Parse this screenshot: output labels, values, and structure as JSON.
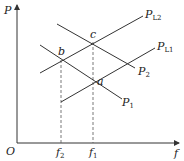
{
  "axes": {
    "y_label": "P",
    "x_label": "f",
    "origin_label": "O"
  },
  "ticks": {
    "f2": {
      "main": "f",
      "sub": "2"
    },
    "f1": {
      "main": "f",
      "sub": "1"
    }
  },
  "points": {
    "a": "a",
    "b": "b",
    "c": "c"
  },
  "curves": {
    "PL2": {
      "main": "P",
      "sub": "L2"
    },
    "PL1": {
      "main": "P",
      "sub": "L1"
    },
    "P2": {
      "main": "P",
      "sub": "2"
    },
    "P1": {
      "main": "P",
      "sub": "1"
    }
  },
  "colors": {
    "line": "#333333",
    "dash": "#555555"
  }
}
